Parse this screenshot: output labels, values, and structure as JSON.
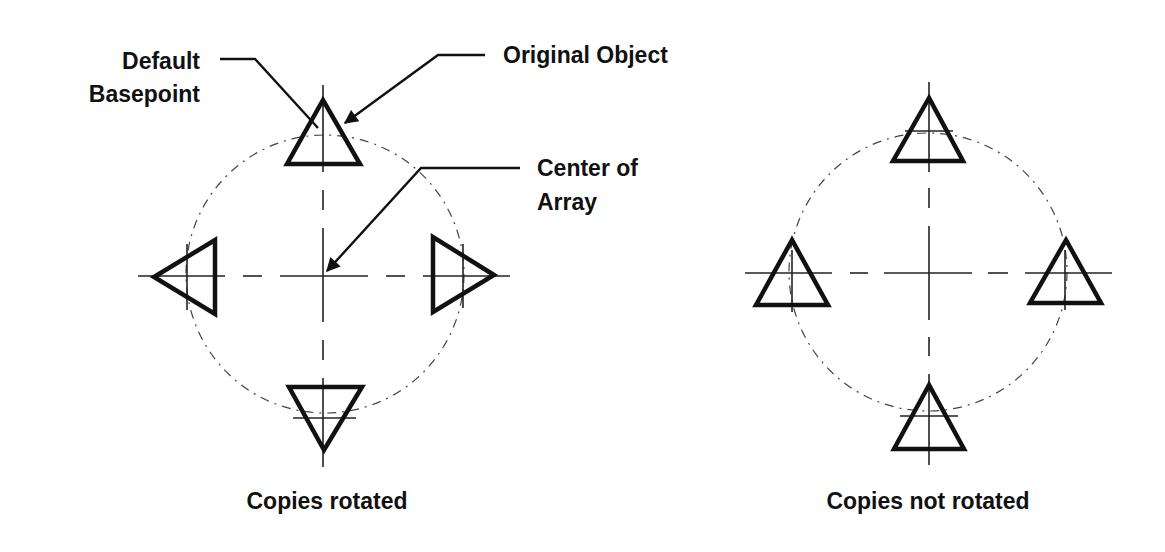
{
  "figure": {
    "left_panel": {
      "caption": "Copies rotated",
      "rotated": true,
      "center": [
        324,
        275
      ],
      "radius": 139,
      "annotations": {
        "default_basepoint": [
          "Default",
          "Basepoint"
        ],
        "original_object": "Original Object",
        "center_of_array": [
          "Center of",
          "Array"
        ]
      }
    },
    "right_panel": {
      "caption": "Copies not rotated",
      "rotated": false,
      "center": [
        928,
        272
      ],
      "radius": 139
    },
    "colors": {
      "ink": "#111111",
      "background": "#ffffff"
    }
  }
}
